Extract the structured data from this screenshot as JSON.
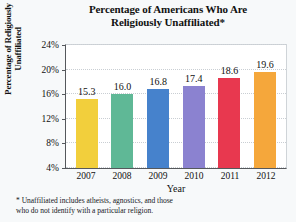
{
  "chart_data": {
    "type": "bar",
    "title": "Percentage of Americans Who Are Religiously Unaffiliated*",
    "title_line1": "Percentage of Americans Who Are",
    "title_line2": "Religiously Unaffiliated*",
    "xlabel": "Year",
    "ylabel": "Percentage of Religiously Unaffiliated",
    "ylabel_line1": "Percentage of Religiously",
    "ylabel_line2": "Unaffiliated",
    "categories": [
      "2007",
      "2008",
      "2009",
      "2010",
      "2011",
      "2012"
    ],
    "values": [
      15.3,
      16.0,
      16.8,
      17.4,
      18.6,
      19.6
    ],
    "value_labels": [
      "15.3",
      "16.0",
      "16.8",
      "17.4",
      "18.6",
      "19.6"
    ],
    "ylim": [
      4,
      24
    ],
    "yticks": [
      4,
      8,
      12,
      16,
      20,
      24
    ],
    "ytick_labels": [
      "4%",
      "8%",
      "12%",
      "16%",
      "20%",
      "24%"
    ],
    "grid": true,
    "legend": "none",
    "bar_colors": [
      "#F2CF3C",
      "#5FB896",
      "#4682CC",
      "#8B82D0",
      "#E8384F",
      "#F5A73B"
    ]
  },
  "footnote": {
    "line1": "* Unaffiliated includes atheists, agnostics, and those",
    "line2": "who do not identify with a particular religion."
  }
}
